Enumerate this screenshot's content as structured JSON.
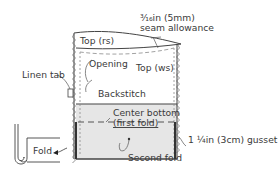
{
  "diagram": {
    "colors": {
      "line": "#444444",
      "dash": "#8a8a8a",
      "fill_bottom": "#e6e6e6",
      "text": "#3a3a3a"
    },
    "labels": {
      "seam_allowance_line1": "³⁄₁₆in (5mm)",
      "seam_allowance_line2": "seam allowance",
      "top_rs": "Top (rs)",
      "opening": "Opening",
      "top_ws": "Top (ws)",
      "linen_tab": "Linen tab",
      "backstitch": "Backstitch",
      "center_bottom": "Center bottom",
      "first_fold": "(first fold)",
      "gusset": "1 ¼in (3cm) gusset",
      "second_fold": "Second fold",
      "fold": "Fold"
    },
    "icons": [
      "fold-inset-icon",
      "linen-tab-icon",
      "arrow-icon"
    ]
  }
}
